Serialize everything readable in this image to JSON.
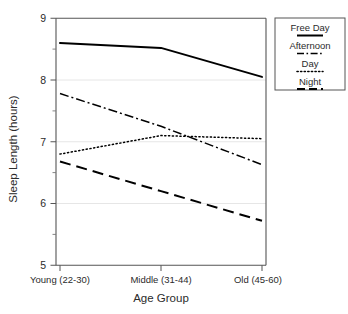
{
  "chart_data": {
    "type": "line",
    "title": "",
    "xlabel": "Age Group",
    "ylabel": "Sleep Length (hours)",
    "categories": [
      "Young (22-30)",
      "Middle (31-44)",
      "Old (45-60)"
    ],
    "ylim": [
      5,
      9
    ],
    "yticks": [
      5,
      6,
      7,
      8,
      9
    ],
    "ytick_labels": [
      "5",
      "6",
      "7",
      "8",
      "9"
    ],
    "y_minor_ticks": [
      5.5,
      6.5,
      7.5,
      8.5
    ],
    "grid": "horizontal-major-faint",
    "legend_position": "outside-top-right",
    "series": [
      {
        "name": "Free Day",
        "style": "solid",
        "color": "#000000",
        "values": [
          8.6,
          8.52,
          8.05
        ]
      },
      {
        "name": "Afternoon",
        "style": "dashdot",
        "color": "#000000",
        "values": [
          7.78,
          7.25,
          6.63
        ]
      },
      {
        "name": "Day",
        "style": "dotted",
        "color": "#000000",
        "values": [
          6.8,
          7.1,
          7.05
        ]
      },
      {
        "name": "Night",
        "style": "dashed",
        "color": "#000000",
        "values": [
          6.68,
          6.2,
          5.72
        ]
      }
    ]
  },
  "legend": {
    "entries": [
      {
        "label": "Free Day",
        "style": "solid"
      },
      {
        "label": "Afternoon",
        "style": "dashdot"
      },
      {
        "label": "Day",
        "style": "dotted"
      },
      {
        "label": "Night",
        "style": "dashed"
      }
    ]
  },
  "axes": {
    "y_title": "Sleep Length (hours)",
    "x_title": "Age Group",
    "y_tick_0": "5",
    "y_tick_1": "6",
    "y_tick_2": "7",
    "y_tick_3": "8",
    "y_tick_4": "9",
    "x_cat_0": "Young (22-30)",
    "x_cat_1": "Middle (31-44)",
    "x_cat_2": "Old (45-60)"
  },
  "colors": {
    "line": "#000000",
    "axis": "#4a4a4a",
    "grid": "#e2e2e2",
    "background": "#ffffff"
  }
}
